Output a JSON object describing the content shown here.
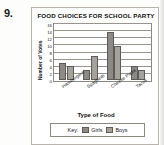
{
  "problem": {
    "number": "9."
  },
  "chart_data": {
    "type": "bar",
    "title": "FOOD CHOICES FOR SCHOOL PARTY",
    "xlabel": "Type of Food",
    "ylabel": "Number of Votes",
    "categories": [
      "Hamburgers",
      "Spaghetti",
      "Cheese Pizza",
      "Tacos"
    ],
    "series": [
      {
        "name": "Girls",
        "values": [
          5,
          3,
          14,
          4
        ],
        "color": "#8d8a85"
      },
      {
        "name": "Boys",
        "values": [
          4,
          7,
          10,
          3
        ],
        "color": "#a5a29c"
      }
    ],
    "ylim": [
      0,
      16
    ],
    "yticks": [
      0,
      2,
      4,
      6,
      8,
      10,
      12,
      14,
      16
    ],
    "grid": true,
    "legend_position": "bottom",
    "legend_prefix": "Key:"
  }
}
